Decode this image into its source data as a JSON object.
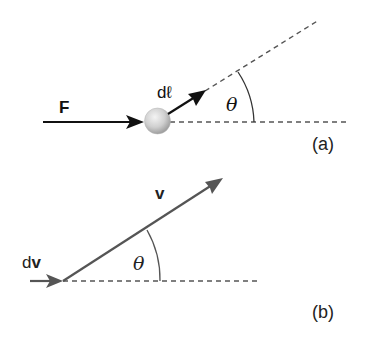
{
  "panel_a": {
    "force_label": "F",
    "displacement_label": "dℓ",
    "angle_label": "θ",
    "panel_label": "(a)"
  },
  "panel_b": {
    "velocity_label": "v",
    "dv_prefix": "d",
    "dv_vector": "v",
    "angle_label": "θ",
    "panel_label": "(b)"
  },
  "colors": {
    "panel_a_ink": "#111111",
    "panel_b_ink": "#555555",
    "dashed": "#555555",
    "sphere_light": "#f2f2f2",
    "sphere_dark": "#a8a8a8"
  }
}
